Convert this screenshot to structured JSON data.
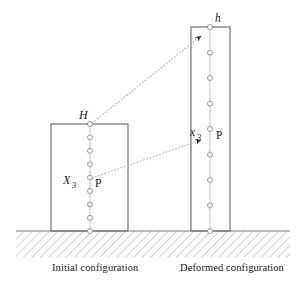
{
  "figure": {
    "type": "diagram",
    "background_color": "#ffffff",
    "line_color": "#555555",
    "ground_hatch_color": "#9a9a9a",
    "dotted_line_color": "#b0b0b0",
    "marker_fill": "#ffffff",
    "marker_stroke": "#8c8c8c",
    "text_color": "#1a1a1a"
  },
  "captions": {
    "initial": "Initial configuration",
    "deformed": "Deformed configuration"
  },
  "labels": {
    "initial_height": "H",
    "deformed_height": "h",
    "initial_coordinate": "X",
    "initial_coordinate_sub": "3",
    "deformed_coordinate": "x",
    "deformed_coordinate_sub": "3",
    "point_initial": "P",
    "point_deformed": "P"
  },
  "initial_block": {
    "name": "initial-configuration-block",
    "x": 51,
    "y": 124,
    "width": 77,
    "height": 107,
    "marker_count": 9,
    "marker_x": 90,
    "marker_top_y": 124,
    "marker_spacing": 13.4,
    "point_p_marker_index": 4,
    "height_label_position": {
      "x": 79,
      "y": 112
    },
    "coordinate_label_position": {
      "x": 66,
      "y": 178
    },
    "point_label_position": {
      "x": 96,
      "y": 183
    }
  },
  "deformed_block": {
    "name": "deformed-configuration-block",
    "x": 191,
    "y": 27,
    "width": 39,
    "height": 204,
    "marker_count": 9,
    "marker_x": 210,
    "marker_top_y": 27,
    "marker_spacing": 25.5,
    "point_p_marker_index": 4,
    "height_label_position": {
      "x": 216,
      "y": 15
    },
    "coordinate_label_position": {
      "x": 193,
      "y": 130
    },
    "point_label_position": {
      "x": 218,
      "y": 137
    }
  },
  "ground": {
    "name": "ground-hatching",
    "top_y": 231,
    "bottom_y": 257,
    "left_x": 16,
    "right_x": 290,
    "hatch_angle_deg": 45,
    "hatch_spacing": 6
  },
  "mapping_arrows": [
    {
      "name": "height-mapping-arrow",
      "from": {
        "x": 90,
        "y": 124
      },
      "to": {
        "x": 202,
        "y": 35
      },
      "style": "dotted",
      "arrowhead": true
    },
    {
      "name": "point-mapping-arrow",
      "from": {
        "x": 90,
        "y": 178
      },
      "to": {
        "x": 202,
        "y": 139
      },
      "style": "dotted",
      "arrowhead": true
    }
  ]
}
